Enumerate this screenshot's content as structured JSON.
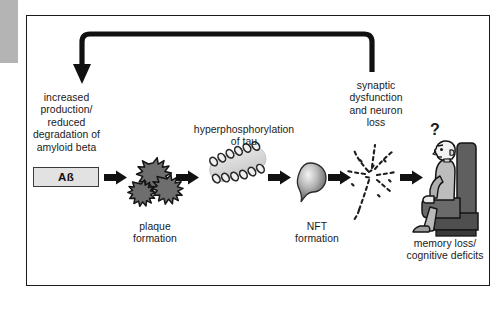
{
  "figure": {
    "frame_border_color": "#1a1a1a",
    "background_color": "#ffffff",
    "left_tab_color": "#b4b4b4"
  },
  "stages": {
    "amyloid": {
      "label": "increased\nproduction/\nreduced\ndegradation of\namyloid beta",
      "box_label": "Aß"
    },
    "plaque": {
      "label": "plaque\nformation",
      "shape": "amyloid-plaque-clusters",
      "fill_color": "#6e6e6e"
    },
    "tau": {
      "label": "hyperphosphorylation\nof tau",
      "shape": "phosphorylated-tau-filament",
      "band_color": "#d8d8d8",
      "phosphate_color": "#3a3a3a"
    },
    "nft": {
      "label": "NFT\nformation",
      "shape": "neurofibrillary-tangle-flame"
    },
    "neuron": {
      "label": "synaptic\ndysfunction\nand neuron\nloss",
      "shape": "degenerating-neuron-dotted"
    },
    "outcome": {
      "label": "memory loss/\ncognitive deficits",
      "question_mark": "?",
      "shape": "elderly-person-in-armchair",
      "chair_color": "#5f5f5f",
      "skin_color": "#f2f2f2"
    }
  },
  "arrows": {
    "feedback_label": "feedback loop from synaptic dysfunction back to amyloid production",
    "step_arrows": 5,
    "color": "#111111"
  }
}
